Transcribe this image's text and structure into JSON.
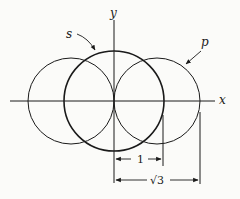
{
  "diagram": {
    "axes": {
      "x_label": "x",
      "y_label": "y"
    },
    "labels": {
      "s_orbital": "s",
      "p_orbital": "p"
    },
    "dimensions": {
      "short": {
        "label": "1"
      },
      "long": {
        "label": "√3"
      }
    },
    "colors": {
      "line": "#1a1a1a",
      "background": "#fbfbf9"
    }
  }
}
